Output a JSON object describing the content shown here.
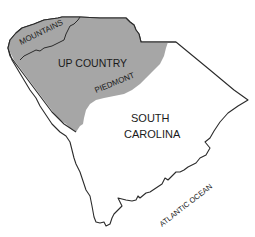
{
  "map": {
    "subject": "South Carolina regions",
    "colors": {
      "up_country_fill": "#a6a6a6",
      "low_country_fill": "#ffffff",
      "border": "#2b2b2b",
      "text": "#1a1a1a"
    },
    "labels": {
      "mountains": "MOUNTAINS",
      "up_country": "UP COUNTRY",
      "piedmont": "PIEDMONT",
      "state_line1": "SOUTH",
      "state_line2": "CAROLINA",
      "ocean": "ATLANTIC OCEAN"
    }
  }
}
